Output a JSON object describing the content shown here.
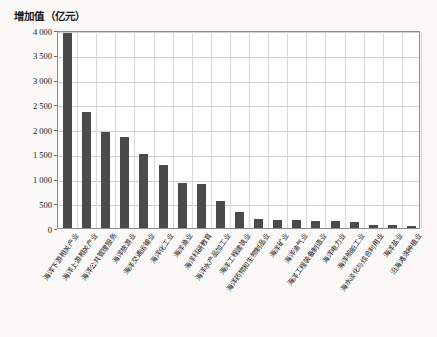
{
  "figure": {
    "axis_title": "增加值（亿元）",
    "bar_color": "#4b4b4b",
    "plot_background": "#ffffff",
    "grid_color": "#cfcfcf",
    "page_background": "#fbfaf8"
  },
  "chart_data": {
    "type": "bar",
    "title": "增加值（亿元）",
    "xlabel": "",
    "ylabel": "增加值（亿元）",
    "ylim": [
      0,
      4000
    ],
    "ytick_labels": [
      "0",
      "500",
      "1 000",
      "1 500",
      "2 000",
      "2 500",
      "3 000",
      "3 500",
      "4 000"
    ],
    "ytick_values": [
      0,
      500,
      1000,
      1500,
      2000,
      2500,
      3000,
      3500,
      4000
    ],
    "grid": true,
    "legend": "none",
    "categories": [
      "海洋下游相关产业",
      "海洋上游相关产业",
      "海洋公共管理服务",
      "海洋旅游业",
      "海洋交通运输业",
      "海洋化工业",
      "海洋渔业",
      "海洋科研教育",
      "海洋水产品加工业",
      "海洋工程建筑业",
      "海洋药物和生物制品业",
      "海洋矿业",
      "海洋油气业",
      "海洋工程装备制造业",
      "海洋电力业",
      "海洋船舶工业",
      "海水淡化与综合利用业",
      "海洋盐业",
      "沿海滩涂种植业"
    ],
    "values": [
      3930,
      2350,
      1930,
      1840,
      1500,
      1280,
      900,
      890,
      540,
      330,
      175,
      160,
      155,
      150,
      140,
      120,
      60,
      55,
      50
    ]
  }
}
